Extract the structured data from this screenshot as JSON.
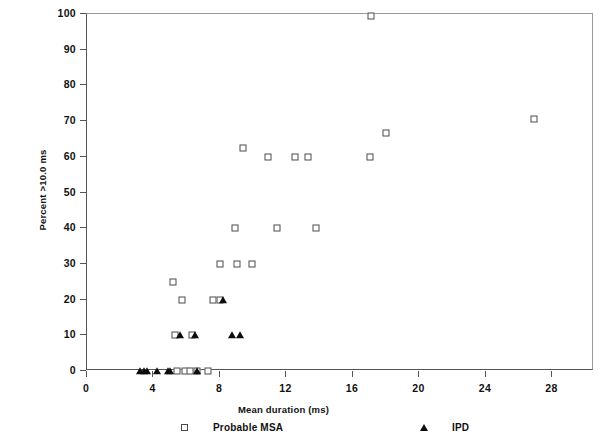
{
  "chart_data": {
    "type": "scatter",
    "title": "",
    "xlabel": "Mean duration (ms)",
    "ylabel": "Percent >10.0 ms",
    "xlim": [
      0,
      30.5
    ],
    "ylim": [
      0,
      100
    ],
    "xticks": [
      0,
      4,
      8,
      12,
      16,
      20,
      24,
      28
    ],
    "yticks": [
      0,
      10,
      20,
      30,
      40,
      50,
      60,
      70,
      80,
      90,
      100
    ],
    "grid": false,
    "legend_position": "below-axis",
    "series": [
      {
        "name": "Probable MSA",
        "marker": "open-square",
        "color": "#4a4a4a",
        "points": [
          [
            17.1,
            99.5
          ],
          [
            26.9,
            70.5
          ],
          [
            18.0,
            66.7
          ],
          [
            9.4,
            62.5
          ],
          [
            10.9,
            60.0
          ],
          [
            12.5,
            60.0
          ],
          [
            13.3,
            60.0
          ],
          [
            17.0,
            60.0
          ],
          [
            8.9,
            40.0
          ],
          [
            11.4,
            40.0
          ],
          [
            13.8,
            40.0
          ],
          [
            8.0,
            30.0
          ],
          [
            9.0,
            30.0
          ],
          [
            9.9,
            30.0
          ],
          [
            5.2,
            25.0
          ],
          [
            5.7,
            20.0
          ],
          [
            7.6,
            20.0
          ],
          [
            8.0,
            20.0
          ],
          [
            5.3,
            10.0
          ],
          [
            6.3,
            10.0
          ],
          [
            5.4,
            0.0
          ],
          [
            5.9,
            0.0
          ],
          [
            6.2,
            0.0
          ],
          [
            6.6,
            0.0
          ],
          [
            7.3,
            0.0
          ]
        ]
      },
      {
        "name": "IPD",
        "marker": "filled-triangle",
        "color": "#0d0d0d",
        "points": [
          [
            8.2,
            20.0
          ],
          [
            5.6,
            10.0
          ],
          [
            6.5,
            10.0
          ],
          [
            8.7,
            10.0
          ],
          [
            9.2,
            10.0
          ],
          [
            3.2,
            0.0
          ],
          [
            3.4,
            0.0
          ],
          [
            3.6,
            0.0
          ],
          [
            4.2,
            0.0
          ],
          [
            4.9,
            0.0
          ],
          [
            5.0,
            0.0
          ],
          [
            6.6,
            0.0
          ]
        ]
      }
    ]
  },
  "axis": {
    "y_tick_labels": [
      "100",
      "90",
      "80",
      "70",
      "60",
      "50",
      "40",
      "30",
      "20",
      "10",
      "0"
    ],
    "x_tick_labels": [
      "0",
      "4",
      "8",
      "12",
      "16",
      "20",
      "24",
      "28"
    ],
    "ylabel": "Percent >10.0 ms",
    "xlabel": "Mean duration (ms)"
  },
  "legend": {
    "entries": [
      {
        "label": "Probable MSA",
        "marker": "open-square-icon"
      },
      {
        "label": "IPD",
        "marker": "filled-triangle-icon"
      }
    ]
  }
}
